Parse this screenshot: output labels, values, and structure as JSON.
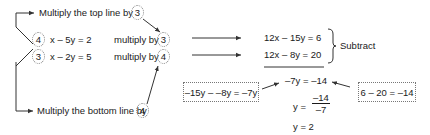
{
  "top_instruction": {
    "label": "Multiply the top line by",
    "factor": "3"
  },
  "bottom_instruction": {
    "label": "Multiply the bottom line by",
    "factor": "4"
  },
  "equations": [
    {
      "cross_factor": "4",
      "text": "x – 5y = 2",
      "multiply_label": "multiply by",
      "multiplier": "3",
      "result": "12x – 15y = 6"
    },
    {
      "cross_factor": "3",
      "text": "x – 2y = 5",
      "multiply_label": "multiply by",
      "multiplier": "4",
      "result": "12x – 8y = 20"
    }
  ],
  "operation": "Subtract",
  "y_working_note": "–15y – –8y = –7y",
  "const_working_note": "6 – 20 = –14",
  "steps": {
    "step1": "–7y = –14",
    "step2_lhs": "y =",
    "step2_numerator": "–14",
    "step2_denominator": "–7",
    "step3": "y = 2"
  },
  "colors": {
    "text": "#1a1a1a",
    "line": "#333333",
    "dotted": "#888888"
  }
}
